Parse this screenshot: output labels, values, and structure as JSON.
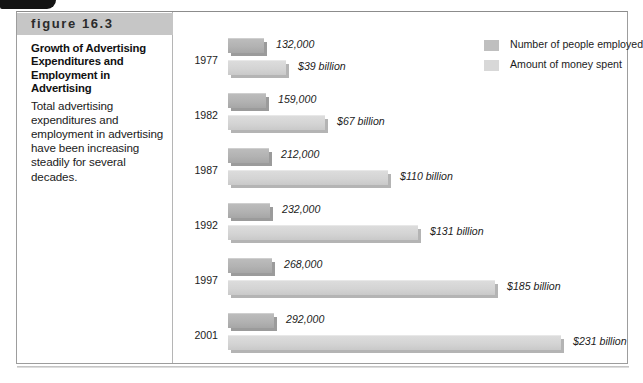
{
  "figure": {
    "label": "figure 16.3",
    "title": "Growth of Advertising Expenditures and Employment in Advertising",
    "description": "Total advertising expenditures and employment in advertising have been increasing steadily for several decades."
  },
  "legend": {
    "items": [
      {
        "name": "employed-swatch",
        "label": "Number of people employed",
        "color": "#bfbfbf"
      },
      {
        "name": "money-swatch",
        "label": "Amount of money spent",
        "color": "#d8d8d8"
      }
    ]
  },
  "chart_data": {
    "type": "bar",
    "orientation": "horizontal",
    "title": "Growth of Advertising Expenditures and Employment in Advertising",
    "xlabel": "",
    "ylabel": "",
    "grid": false,
    "legend_position": "top-right",
    "categories": [
      "1977",
      "1982",
      "1987",
      "1992",
      "1997",
      "2001"
    ],
    "series": [
      {
        "name": "Number of people employed",
        "color": "#bfbfbf",
        "unit": "people",
        "values": [
          132000,
          159000,
          212000,
          232000,
          268000,
          292000
        ],
        "labels": [
          "132,000",
          "159,000",
          "212,000",
          "232,000",
          "268,000",
          "292,000"
        ]
      },
      {
        "name": "Amount of money spent",
        "color": "#d8d8d8",
        "unit": "billions of dollars",
        "values": [
          39,
          67,
          110,
          131,
          185,
          231
        ],
        "labels": [
          "$39 billion",
          "$67 billion",
          "$110 billion",
          "$131 billion",
          "$185 billion",
          "$231 billion"
        ]
      }
    ]
  },
  "groups": [
    {
      "year": "1977",
      "employed_label": "132,000",
      "employed_width": 36,
      "money_label": "$39 billion",
      "money_width": 58
    },
    {
      "year": "1982",
      "employed_label": "159,000",
      "employed_width": 38,
      "money_label": "$67 billion",
      "money_width": 97
    },
    {
      "year": "1987",
      "employed_label": "212,000",
      "employed_width": 41,
      "money_label": "$110 billion",
      "money_width": 160
    },
    {
      "year": "1992",
      "employed_label": "232,000",
      "employed_width": 42,
      "money_label": "$131 billion",
      "money_width": 190
    },
    {
      "year": "1997",
      "employed_label": "268,000",
      "employed_width": 44,
      "money_label": "$185 billion",
      "money_width": 267
    },
    {
      "year": "2001",
      "employed_label": "292,000",
      "employed_width": 46,
      "money_label": "$231 billion",
      "money_width": 333
    }
  ]
}
